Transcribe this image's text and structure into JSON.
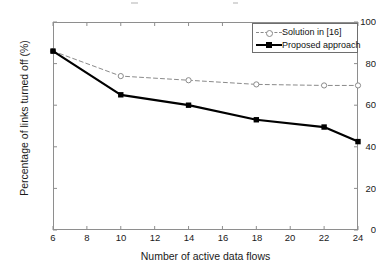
{
  "figure": {
    "background": "#ffffff",
    "frame_color": "#8e8e8e"
  },
  "axes": {
    "x": {
      "label": "Number of active data flows",
      "ticks": [
        6,
        8,
        10,
        12,
        14,
        16,
        18,
        20,
        22,
        24
      ],
      "min": 6,
      "max": 24
    },
    "y": {
      "label": "Percentage of links turned off (%)",
      "ticks": [
        0,
        20,
        40,
        60,
        80,
        100
      ],
      "min": 0,
      "max": 100
    }
  },
  "legend": {
    "position": "top-right",
    "entries": [
      {
        "label": "Solution in [16]",
        "style": "dashed",
        "marker": "circle",
        "color": "#8a8a8a"
      },
      {
        "label": "Proposed approach",
        "style": "solid",
        "marker": "square",
        "color": "#000000"
      }
    ]
  },
  "chart_data": {
    "type": "line",
    "title": "",
    "subtitle": "",
    "xlabel": "Number of active data flows",
    "ylabel": "Percentage of links turned off (%)",
    "xlim": [
      6,
      24
    ],
    "ylim": [
      0,
      100
    ],
    "xticks": [
      6,
      8,
      10,
      12,
      14,
      16,
      18,
      20,
      22,
      24
    ],
    "yticks": [
      0,
      20,
      40,
      60,
      80,
      100
    ],
    "grid": false,
    "legend_position": "top-right",
    "x": [
      6,
      10,
      14,
      18,
      22,
      24
    ],
    "series": [
      {
        "name": "Solution in [16]",
        "values": [
          86,
          74,
          72,
          70,
          69.5,
          69.5
        ],
        "color": "#8a8a8a",
        "linestyle": "dashed",
        "marker": "circle"
      },
      {
        "name": "Proposed approach",
        "values": [
          86,
          65,
          60,
          53,
          49.5,
          42.5
        ],
        "color": "#000000",
        "linestyle": "solid",
        "marker": "square"
      }
    ]
  }
}
